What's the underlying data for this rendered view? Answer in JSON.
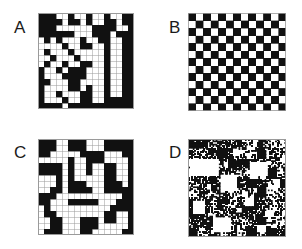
{
  "figure": {
    "width": 302,
    "height": 249,
    "background": "#ffffff",
    "ink_color": "#111111",
    "cell_color": "#ffffff",
    "grid_line_color": "#9a9a9a",
    "layout": "2x2 panel grid"
  },
  "panels": [
    {
      "id": "a",
      "label": "A",
      "pattern_type": "clustered-binary-grid",
      "rows": 16,
      "cols": 16,
      "description": "Irregular clustered black/white cell pattern on a 16x16 ruled grid",
      "cells": [
        "1110010010010011",
        "1111011010011011",
        "1110000001111001",
        "1111110001110111",
        "0101000100110011",
        "0000100110010011",
        "0100010000010011",
        "0010001000010011",
        "0100100110010011",
        "1001011100010011",
        "1000111100010011",
        "1100011000010011",
        "1000011010010011",
        "1001000110010011",
        "1000100110011111",
        "1111011111111111"
      ]
    },
    {
      "id": "b",
      "label": "B",
      "pattern_type": "regular-checkerboard",
      "rows": 13,
      "cols": 13,
      "description": "Perfectly alternating checkerboard of black and white squares",
      "start_filled": true
    },
    {
      "id": "c",
      "label": "C",
      "pattern_type": "clustered-binary-grid",
      "rows": 16,
      "cols": 16,
      "description": "Irregular pattern with larger contiguous black and white blobs on a 16x16 ruled grid",
      "cells": [
        "1110011100011111",
        "1110011100011111",
        "1100000111100011",
        "0000010011100001",
        "1111010010011001",
        "1111010010011001",
        "0001010000011001",
        "0001011100011101",
        "0011011110011111",
        "1110000000000011",
        "1100011111000111",
        "0100000000001111",
        "0110000000011001",
        "0011000111011001",
        "0011000111000001",
        "0111000110000011"
      ]
    },
    {
      "id": "d",
      "label": "D",
      "pattern_type": "multiscale-fractal-noise",
      "rows": 64,
      "cols": 64,
      "description": "Fine-grained hierarchical random texture with nested white square voids at multiple scales",
      "fill_probability": 0.52,
      "void_squares": [
        {
          "x": 0.02,
          "y": 0.2,
          "w": 0.3,
          "h": 0.18
        },
        {
          "x": 0.33,
          "y": 0.36,
          "w": 0.17,
          "h": 0.17
        },
        {
          "x": 0.62,
          "y": 0.24,
          "w": 0.2,
          "h": 0.13
        },
        {
          "x": 0.05,
          "y": 0.62,
          "w": 0.12,
          "h": 0.14
        },
        {
          "x": 0.25,
          "y": 0.8,
          "w": 0.18,
          "h": 0.16
        },
        {
          "x": 0.58,
          "y": 0.6,
          "w": 0.09,
          "h": 0.09
        },
        {
          "x": 0.8,
          "y": 0.72,
          "w": 0.08,
          "h": 0.08
        },
        {
          "x": 0.45,
          "y": 0.1,
          "w": 0.07,
          "h": 0.07
        },
        {
          "x": 0.7,
          "y": 0.88,
          "w": 0.1,
          "h": 0.07
        },
        {
          "x": 0.88,
          "y": 0.4,
          "w": 0.06,
          "h": 0.1
        },
        {
          "x": 0.18,
          "y": 0.45,
          "w": 0.06,
          "h": 0.06
        },
        {
          "x": 0.5,
          "y": 0.7,
          "w": 0.05,
          "h": 0.05
        }
      ]
    }
  ]
}
